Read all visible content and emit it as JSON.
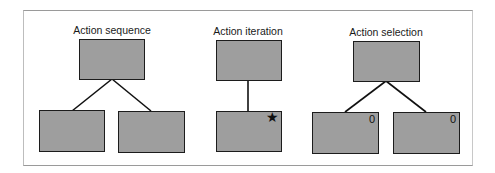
{
  "diagrams": [
    {
      "title": "Action sequence",
      "children": [
        {
          "marker": ""
        },
        {
          "marker": ""
        }
      ]
    },
    {
      "title": "Action iteration",
      "children": [
        {
          "marker": "★"
        }
      ]
    },
    {
      "title": "Action selection",
      "children": [
        {
          "marker": "0"
        },
        {
          "marker": "0"
        }
      ]
    }
  ],
  "colors": {
    "box_fill": "#9e9e9e",
    "box_border": "#1c1c1c",
    "line": "#111111",
    "frame": "#9a9a9a"
  }
}
